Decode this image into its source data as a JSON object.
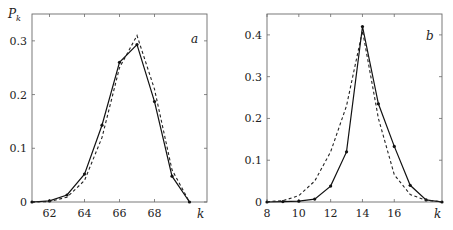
{
  "chart_data": [
    {
      "type": "line",
      "panel_label": "a",
      "title": "",
      "xlabel": "k",
      "ylabel": "P_k",
      "xlim": [
        61,
        71
      ],
      "ylim": [
        0,
        0.35
      ],
      "x_ticks": [
        62,
        64,
        66,
        68
      ],
      "x_tick_labels": [
        "62",
        "64",
        "66",
        "68"
      ],
      "y_ticks": [
        0,
        0.1,
        0.2,
        0.3
      ],
      "y_tick_labels": [
        "0",
        "0.1",
        "0.2",
        "0.3"
      ],
      "grid": false,
      "legend": null,
      "series": [
        {
          "name": "solid (with markers)",
          "style": "solid",
          "x": [
            61,
            62,
            63,
            64,
            65,
            66,
            67,
            68,
            69,
            70
          ],
          "values": [
            0,
            0.002,
            0.013,
            0.052,
            0.143,
            0.26,
            0.293,
            0.187,
            0.048,
            0
          ]
        },
        {
          "name": "dashed",
          "style": "dashed",
          "x": [
            61,
            62,
            63,
            64,
            65,
            66,
            67,
            68,
            69,
            70
          ],
          "values": [
            0,
            0.001,
            0.009,
            0.04,
            0.12,
            0.25,
            0.31,
            0.21,
            0.06,
            0
          ]
        }
      ]
    },
    {
      "type": "line",
      "panel_label": "b",
      "title": "",
      "xlabel": "k",
      "ylabel": "",
      "xlim": [
        8,
        19
      ],
      "ylim": [
        0,
        0.45
      ],
      "x_ticks": [
        8,
        10,
        12,
        14,
        16
      ],
      "x_tick_labels": [
        "8",
        "10",
        "12",
        "14",
        "16"
      ],
      "y_ticks": [
        0,
        0.1,
        0.2,
        0.3,
        0.4
      ],
      "y_tick_labels": [
        "0",
        "0.1",
        "0.2",
        "0.3",
        "0.4"
      ],
      "grid": false,
      "legend": null,
      "series": [
        {
          "name": "solid (with markers)",
          "style": "solid",
          "x": [
            8,
            9,
            10,
            11,
            12,
            13,
            14,
            15,
            16,
            17,
            18,
            19
          ],
          "values": [
            0,
            0.001,
            0.002,
            0.007,
            0.038,
            0.12,
            0.42,
            0.235,
            0.133,
            0.04,
            0.005,
            0
          ]
        },
        {
          "name": "dashed",
          "style": "dashed",
          "x": [
            8,
            9,
            10,
            11,
            12,
            13,
            14,
            15,
            16,
            17,
            18,
            19
          ],
          "values": [
            0.001,
            0.003,
            0.015,
            0.05,
            0.12,
            0.23,
            0.41,
            0.2,
            0.065,
            0.018,
            0.004,
            0.001
          ]
        }
      ]
    }
  ],
  "labels": {
    "ylabel_main": "P",
    "ylabel_sub": "k",
    "panel_a": "a",
    "panel_b": "b",
    "xlabel_a": "k",
    "xlabel_b": "k"
  }
}
